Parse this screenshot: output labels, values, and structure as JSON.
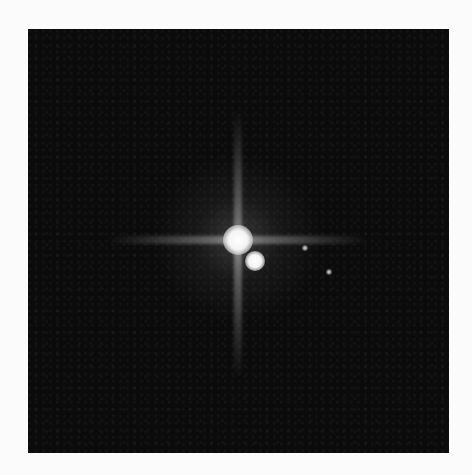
{
  "image": {
    "subject": "astronomical image of a bright primary body with a nearby companion and faint satellites against a dark background",
    "colors": {
      "page_background": "#fbfbfb",
      "frame_background": "#0b0b0b",
      "highlight": "#ffffff"
    },
    "objects": [
      {
        "name": "primary-body",
        "x": 238,
        "y": 240,
        "diameter": 26
      },
      {
        "name": "companion-body",
        "x": 256,
        "y": 262,
        "diameter": 18
      },
      {
        "name": "faint-moon-1",
        "x": 305,
        "y": 248,
        "diameter": 5
      },
      {
        "name": "faint-moon-2",
        "x": 329,
        "y": 272,
        "diameter": 5
      }
    ]
  }
}
